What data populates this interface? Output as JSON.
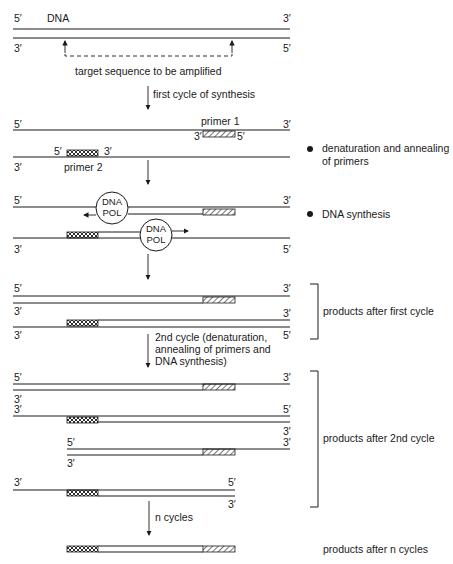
{
  "figure": {
    "dna_label": "DNA",
    "target_label": "target sequence to be amplified",
    "end_5": "5′",
    "end_3": "3′",
    "primer1_label": "primer 1",
    "primer2_label": "primer 2",
    "pol_line1": "DNA",
    "pol_line2": "POL"
  },
  "steps": {
    "first_cycle": "first cycle of synthesis",
    "second_cycle_l1": "2nd cycle (denaturation,",
    "second_cycle_l2": "annealing of primers and",
    "second_cycle_l3": "DNA synthesis)",
    "n_cycles": "n cycles"
  },
  "annotations": {
    "denaturation_l1": "denaturation and annealing",
    "denaturation_l2": "of primers",
    "synthesis": "DNA synthesis",
    "products_first": "products after first cycle",
    "products_second": "products after 2nd cycle",
    "products_n": "products after n cycles"
  },
  "colors": {
    "ink": "#1a1a1a",
    "background": "#ffffff"
  }
}
